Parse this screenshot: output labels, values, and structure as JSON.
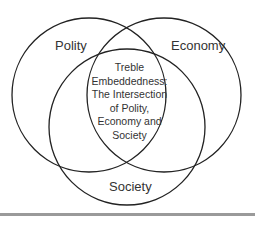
{
  "diagram": {
    "type": "venn",
    "sets": [
      {
        "name": "Polity"
      },
      {
        "name": "Economy"
      },
      {
        "name": "Society"
      }
    ],
    "intersection_label_lines": [
      "Treble",
      "Embeddedness:",
      "The Intersection",
      "of Polity,",
      "Economy and",
      "Society"
    ],
    "stroke_color": "#222222",
    "text_color": "#333333",
    "rule_color": "#9a9a9a"
  }
}
